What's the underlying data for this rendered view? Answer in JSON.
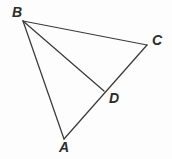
{
  "figure": {
    "background_color": "#fdfdfd",
    "stroke_color": "#3a3a3a",
    "label_color": "#2b2b2b",
    "width": 172,
    "height": 159,
    "type": "geometry-diagram"
  },
  "points": {
    "A": {
      "label": "A",
      "x": 64,
      "y": 139
    },
    "B": {
      "label": "B",
      "x": 23,
      "y": 21
    },
    "C": {
      "label": "C",
      "x": 147,
      "y": 45
    },
    "D": {
      "label": "D",
      "x": 104,
      "y": 91
    }
  },
  "segments": [
    {
      "name": "BC",
      "from": "B",
      "to": "C"
    },
    {
      "name": "BA",
      "from": "B",
      "to": "A"
    },
    {
      "name": "BD",
      "from": "B",
      "to": "D"
    },
    {
      "name": "AC",
      "from": "A",
      "to": "C"
    }
  ]
}
